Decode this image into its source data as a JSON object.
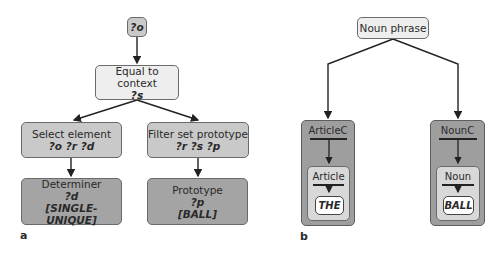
{
  "panel_a": {
    "label": "a",
    "nodes": {
      "root": {
        "var": "?o"
      },
      "equal": {
        "title": "Equal to context",
        "vars": "?s"
      },
      "select": {
        "title": "Select element",
        "vars": "?o ?r ?d"
      },
      "filter": {
        "title": "Filter set prototype",
        "vars": "?r ?s ?p"
      },
      "determiner": {
        "title": "Determiner",
        "vars": "?d",
        "value": "[SINGLE-UNIQUE]"
      },
      "prototype": {
        "title": "Prototype",
        "vars": "?p",
        "value": "[BALL]"
      }
    }
  },
  "panel_b": {
    "label": "b",
    "root": {
      "title": "Noun phrase"
    },
    "constituents": [
      {
        "outer": "ArticleC",
        "inner": "Article",
        "word": "THE"
      },
      {
        "outer": "NounC",
        "inner": "Noun",
        "word": "BALL"
      }
    ]
  },
  "colors": {
    "light_fill": "#eeeeee",
    "mid_fill": "#c9c9c9",
    "dark_fill": "#a4a4a4",
    "stroke": "#222222"
  }
}
